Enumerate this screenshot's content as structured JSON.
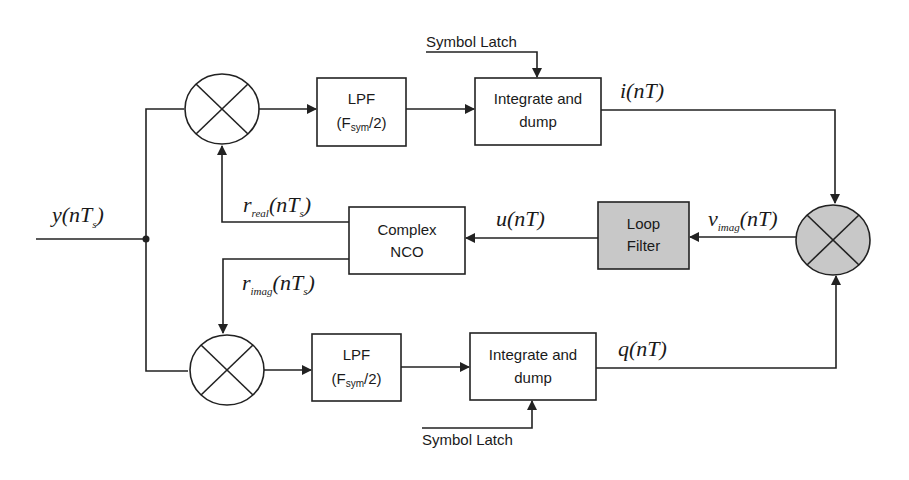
{
  "diagram": {
    "type": "block-diagram",
    "input": {
      "label_main": "y(nT",
      "label_sub": "s",
      "label_close": ")"
    },
    "blocks": {
      "lpf_top": {
        "line1": "LPF",
        "line2_pre": "(F",
        "line2_sub": "sym",
        "line2_post": "/2)"
      },
      "lpf_bottom": {
        "line1": "LPF",
        "line2_pre": "(F",
        "line2_sub": "sym",
        "line2_post": "/2)"
      },
      "integrate_top": {
        "line1": "Integrate and",
        "line2": "dump"
      },
      "integrate_bottom": {
        "line1": "Integrate and",
        "line2": "dump"
      },
      "nco": {
        "line1": "Complex",
        "line2": "NCO"
      },
      "loop_filter": {
        "line1": "Loop",
        "line2": "Filter",
        "fill": "#c8c8c8"
      }
    },
    "multipliers": {
      "top": {
        "symbol": "multiply"
      },
      "bottom": {
        "symbol": "multiply"
      },
      "phase_detector": {
        "symbol": "multiply",
        "fill": "#c8c8c8"
      }
    },
    "latch": {
      "top": "Symbol Latch",
      "bottom": "Symbol Latch"
    },
    "signals": {
      "i": {
        "main": "i(nT)"
      },
      "q": {
        "main": "q(nT)"
      },
      "u": {
        "main": "u(nT)"
      },
      "v": {
        "var": "v",
        "sub": "imag",
        "rest": "(nT)"
      },
      "r_real": {
        "var": "r",
        "sub": "real",
        "rest": "(nT",
        "sub2": "s",
        "close": ")"
      },
      "r_imag": {
        "var": "r",
        "sub": "imag",
        "rest": "(nT",
        "sub2": "s",
        "close": ")"
      }
    }
  }
}
